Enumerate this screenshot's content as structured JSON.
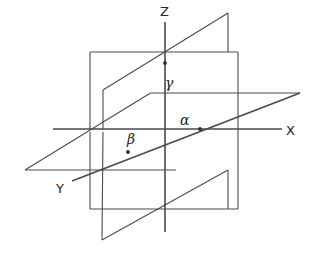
{
  "figure": {
    "background_color": "#ffffff",
    "line_color": "#4a4a4a",
    "label_color": "#242424",
    "width": 317,
    "height": 255
  },
  "axes": [
    {
      "id": "z-axis",
      "label": "Z",
      "orientation": "vertical",
      "from": [
        165,
        22
      ],
      "to": [
        165,
        232
      ],
      "label_position": [
        165,
        12
      ]
    },
    {
      "id": "x-axis",
      "label": "X",
      "orientation": "horizontal",
      "from": [
        53,
        129
      ],
      "to": [
        282,
        129
      ],
      "label_position": [
        291,
        132
      ]
    },
    {
      "id": "y-axis",
      "label": "Y",
      "orientation": "oblique",
      "from": [
        300,
        93
      ],
      "to": [
        72,
        181
      ],
      "label_position": [
        62,
        190
      ]
    }
  ],
  "planes": [
    {
      "id": "xz-plane",
      "name": "frontal rectangle",
      "shape": "rectangle",
      "vertices": [
        [
          90,
          52
        ],
        [
          238,
          52
        ],
        [
          238,
          209
        ],
        [
          90,
          209
        ]
      ]
    },
    {
      "id": "yz-plane",
      "name": "oblique parallelogram",
      "shape": "parallelogram",
      "vertices": [
        [
          103,
          90
        ],
        [
          228,
          13
        ],
        [
          228,
          52
        ],
        [
          228,
          170
        ],
        [
          102,
          240
        ],
        [
          103,
          90
        ]
      ]
    },
    {
      "id": "xy-plane",
      "name": "horizontal parallelogram",
      "shape": "parallelogram",
      "vertices": [
        [
          25,
          170
        ],
        [
          150,
          93
        ],
        [
          300,
          93
        ],
        [
          175,
          170
        ]
      ]
    }
  ],
  "points": [
    {
      "id": "point-alpha",
      "label": "α",
      "label_name": "alpha",
      "lies_on": "x-axis",
      "dot_position": [
        200,
        129
      ],
      "label_position": [
        186,
        121
      ]
    },
    {
      "id": "point-beta",
      "label": "β",
      "label_name": "beta",
      "lies_on": "y-axis",
      "dot_position": [
        128,
        152
      ],
      "label_position": [
        133,
        140
      ]
    },
    {
      "id": "point-gamma",
      "label": "γ",
      "label_name": "gamma",
      "lies_on": "z-axis",
      "dot_position": [
        165,
        63
      ],
      "label_position": [
        170,
        85
      ]
    }
  ]
}
